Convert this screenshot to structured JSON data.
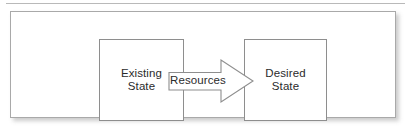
{
  "diagram": {
    "colors": {
      "background": "#ffffff",
      "panel_border": "#a9a9a9",
      "box_border": "#8e8e8e",
      "arrow_fill": "#ffffff",
      "arrow_border": "#8e8e8e",
      "text": "#2b2b2b",
      "rule": "#b9b9b9"
    },
    "nodes": [
      {
        "id": "existing-state",
        "shape": "rectangle",
        "lines": [
          "Existing",
          "State"
        ]
      },
      {
        "id": "desired-state",
        "shape": "rectangle",
        "lines": [
          "Desired",
          "State"
        ]
      }
    ],
    "connector": {
      "id": "resources-arrow",
      "shape": "block-arrow",
      "direction": "right",
      "label": "Resources",
      "from": "existing-state",
      "to": "desired-state"
    }
  }
}
